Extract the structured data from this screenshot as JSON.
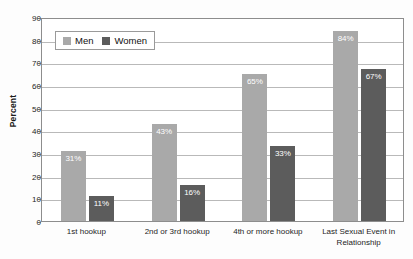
{
  "title": {
    "text": "",
    "visible_note": "cropped"
  },
  "legend": {
    "position": "top-left-inside",
    "entries": [
      {
        "label": "Men",
        "color": "#a9a9a9",
        "swatch_name": "legend-swatch-men"
      },
      {
        "label": "Women",
        "color": "#5c5c5c",
        "swatch_name": "legend-swatch-women"
      }
    ]
  },
  "axes": {
    "ylabel": "Percent",
    "yticks": [
      "90",
      "80",
      "70",
      "60",
      "50",
      "40",
      "30",
      "20",
      "10",
      "0"
    ]
  },
  "bar_labels": {
    "men": [
      "31%",
      "43%",
      "65%",
      "84%"
    ],
    "women": [
      "11%",
      "16%",
      "33%",
      "67%"
    ]
  },
  "categories": [
    "1st hookup",
    "2nd or 3rd hookup",
    "4th or more hookup",
    "Last Sexual Event in Relationship"
  ],
  "chart_data": {
    "type": "bar",
    "title": "",
    "xlabel": "",
    "ylabel": "Percent",
    "ylim": [
      0,
      90
    ],
    "ytick_step": 10,
    "grid": true,
    "legend_position": "upper left",
    "categories": [
      "1st hookup",
      "2nd or 3rd hookup",
      "4th or more hookup",
      "Last Sexual Event in Relationship"
    ],
    "series": [
      {
        "name": "Men",
        "color": "#a9a9a9",
        "values": [
          31,
          43,
          65,
          84
        ],
        "data_labels": [
          "31%",
          "43%",
          "65%",
          "84%"
        ]
      },
      {
        "name": "Women",
        "color": "#5c5c5c",
        "values": [
          11,
          16,
          33,
          67
        ],
        "data_labels": [
          "11%",
          "16%",
          "33%",
          "67%"
        ]
      }
    ]
  }
}
